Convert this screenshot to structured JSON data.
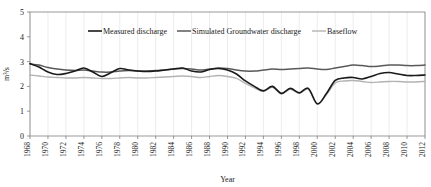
{
  "chart_data": {
    "type": "line",
    "title": "",
    "xlabel": "Year",
    "ylabel": "m3/s",
    "ylabel_display": "m³/s",
    "xlim": [
      1968,
      2012
    ],
    "ylim": [
      0,
      5
    ],
    "yticks": [
      0,
      1,
      2,
      3,
      4,
      5
    ],
    "xticks": [
      1968,
      1970,
      1972,
      1974,
      1976,
      1978,
      1980,
      1982,
      1984,
      1986,
      1988,
      1990,
      1992,
      1994,
      1996,
      1998,
      2000,
      2002,
      2004,
      2006,
      2008,
      2010,
      2012
    ],
    "xtick_labels": [
      "1968",
      "1970",
      "1972",
      "1974",
      "1976",
      "1978",
      "1980",
      "1982",
      "1984",
      "1986",
      "1988",
      "1990",
      "1992",
      "1994",
      "1996",
      "1998",
      "2000",
      "2002",
      "2004",
      "2006",
      "2008",
      "2010",
      "2012"
    ],
    "ytick_labels": [
      "0",
      "1",
      "2",
      "3",
      "4",
      "5"
    ],
    "grid": "vertical",
    "legend_position": "top-center",
    "x": [
      1968,
      1969,
      1970,
      1971,
      1972,
      1973,
      1974,
      1975,
      1976,
      1977,
      1978,
      1979,
      1980,
      1981,
      1982,
      1983,
      1984,
      1985,
      1986,
      1987,
      1988,
      1989,
      1990,
      1991,
      1992,
      1993,
      1994,
      1995,
      1996,
      1997,
      1998,
      1999,
      2000,
      2001,
      2002,
      2003,
      2004,
      2005,
      2006,
      2007,
      2008,
      2009,
      2010,
      2011,
      2012
    ],
    "series": [
      {
        "name": "Measured discharge",
        "color": "#1a1a1a",
        "width": 1.6,
        "values": [
          2.92,
          2.78,
          2.58,
          2.48,
          2.52,
          2.62,
          2.74,
          2.58,
          2.4,
          2.55,
          2.72,
          2.66,
          2.62,
          2.6,
          2.62,
          2.66,
          2.7,
          2.74,
          2.62,
          2.58,
          2.68,
          2.72,
          2.66,
          2.5,
          2.22,
          2.0,
          1.82,
          2.0,
          1.72,
          1.92,
          1.74,
          1.92,
          1.3,
          1.7,
          2.24,
          2.34,
          2.36,
          2.3,
          2.4,
          2.52,
          2.56,
          2.5,
          2.44,
          2.44,
          2.46
        ]
      },
      {
        "name": "Simulated Groundwater discharge",
        "color": "#595959",
        "width": 1.5,
        "values": [
          2.9,
          2.86,
          2.76,
          2.7,
          2.66,
          2.64,
          2.66,
          2.62,
          2.58,
          2.58,
          2.62,
          2.64,
          2.62,
          2.62,
          2.64,
          2.66,
          2.7,
          2.72,
          2.7,
          2.66,
          2.7,
          2.74,
          2.72,
          2.66,
          2.62,
          2.62,
          2.66,
          2.7,
          2.68,
          2.7,
          2.72,
          2.74,
          2.7,
          2.68,
          2.74,
          2.8,
          2.86,
          2.84,
          2.8,
          2.82,
          2.86,
          2.86,
          2.84,
          2.84,
          2.86
        ]
      },
      {
        "name": "Baseflow",
        "color": "#b3b3b3",
        "width": 1.4,
        "values": [
          2.46,
          2.42,
          2.38,
          2.36,
          2.34,
          2.34,
          2.36,
          2.34,
          2.32,
          2.32,
          2.34,
          2.36,
          2.34,
          2.34,
          2.36,
          2.38,
          2.4,
          2.42,
          2.4,
          2.36,
          2.4,
          2.44,
          2.4,
          2.32,
          2.12,
          1.94,
          1.8,
          1.96,
          1.7,
          1.88,
          1.72,
          1.88,
          1.28,
          1.66,
          2.14,
          2.22,
          2.24,
          2.2,
          2.16,
          2.18,
          2.2,
          2.2,
          2.18,
          2.18,
          2.2
        ]
      }
    ]
  },
  "legend": {
    "items": [
      {
        "label": "Measured discharge"
      },
      {
        "label": "Simulated Groundwater discharge"
      },
      {
        "label": "Baseflow"
      }
    ]
  },
  "axes": {
    "x_title": "Year",
    "y_title": "m³/s"
  }
}
